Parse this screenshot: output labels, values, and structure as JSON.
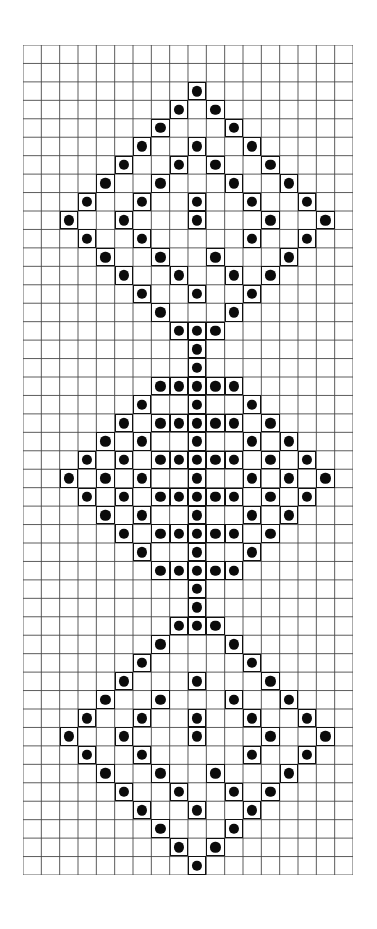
{
  "document": {
    "title": "Beadwork / Cross-Stitch Diamond Motif Chart",
    "media": "graph-paper",
    "background_color": "#ffffff",
    "grid_line_color": "#4a4a4a",
    "cell_outline_color": "#121212",
    "bead_color": "#0b0b0b"
  },
  "chart_data": {
    "type": "heatmap",
    "title": "Beadwork / Cross-Stitch Diamond Motif Chart",
    "xlabel": "",
    "ylabel": "",
    "grid": true,
    "legend_position": "none",
    "columns": 18,
    "rows": 45,
    "cell_width_px": 18.33,
    "cell_height_px": 18.44,
    "origin_px": {
      "x": 23,
      "y": 45
    },
    "value_meaning": {
      "0": "empty square",
      "1": "bead / stitch"
    },
    "motifs": [
      {
        "name": "top-diamond",
        "style": "open-lattice",
        "row_start": 2,
        "row_end": 15,
        "center_column": 9
      },
      {
        "name": "middle-diamond",
        "style": "dense-filled",
        "row_start": 16,
        "row_end": 30,
        "center_column": 9
      },
      {
        "name": "bottom-diamond",
        "style": "open-lattice",
        "row_start": 30,
        "row_end": 44,
        "center_column": 9
      }
    ],
    "filled_cells": [
      [
        2,
        9
      ],
      [
        3,
        8
      ],
      [
        3,
        10
      ],
      [
        4,
        7
      ],
      [
        4,
        11
      ],
      [
        5,
        6
      ],
      [
        5,
        9
      ],
      [
        5,
        12
      ],
      [
        6,
        5
      ],
      [
        6,
        8
      ],
      [
        6,
        10
      ],
      [
        6,
        13
      ],
      [
        7,
        4
      ],
      [
        7,
        7
      ],
      [
        7,
        11
      ],
      [
        7,
        14
      ],
      [
        8,
        3
      ],
      [
        8,
        6
      ],
      [
        8,
        9
      ],
      [
        8,
        12
      ],
      [
        8,
        15
      ],
      [
        9,
        2
      ],
      [
        9,
        5
      ],
      [
        9,
        9
      ],
      [
        9,
        13
      ],
      [
        9,
        16
      ],
      [
        10,
        3
      ],
      [
        10,
        6
      ],
      [
        10,
        12
      ],
      [
        10,
        15
      ],
      [
        11,
        4
      ],
      [
        11,
        7
      ],
      [
        11,
        10
      ],
      [
        11,
        14
      ],
      [
        12,
        5
      ],
      [
        12,
        8
      ],
      [
        12,
        11
      ],
      [
        12,
        13
      ],
      [
        13,
        6
      ],
      [
        13,
        9
      ],
      [
        13,
        12
      ],
      [
        14,
        7
      ],
      [
        14,
        11
      ],
      [
        15,
        8
      ],
      [
        15,
        9
      ],
      [
        15,
        10
      ],
      [
        16,
        9
      ],
      [
        17,
        9
      ],
      [
        18,
        7
      ],
      [
        18,
        8
      ],
      [
        18,
        9
      ],
      [
        18,
        10
      ],
      [
        18,
        11
      ],
      [
        19,
        6
      ],
      [
        19,
        9
      ],
      [
        19,
        12
      ],
      [
        20,
        5
      ],
      [
        20,
        7
      ],
      [
        20,
        8
      ],
      [
        20,
        9
      ],
      [
        20,
        10
      ],
      [
        20,
        11
      ],
      [
        20,
        13
      ],
      [
        21,
        4
      ],
      [
        21,
        6
      ],
      [
        21,
        9
      ],
      [
        21,
        12
      ],
      [
        21,
        14
      ],
      [
        22,
        3
      ],
      [
        22,
        5
      ],
      [
        22,
        7
      ],
      [
        22,
        8
      ],
      [
        22,
        9
      ],
      [
        22,
        10
      ],
      [
        22,
        11
      ],
      [
        22,
        13
      ],
      [
        22,
        15
      ],
      [
        23,
        2
      ],
      [
        23,
        4
      ],
      [
        23,
        6
      ],
      [
        23,
        9
      ],
      [
        23,
        12
      ],
      [
        23,
        14
      ],
      [
        23,
        16
      ],
      [
        24,
        3
      ],
      [
        24,
        5
      ],
      [
        24,
        7
      ],
      [
        24,
        8
      ],
      [
        24,
        9
      ],
      [
        24,
        10
      ],
      [
        24,
        11
      ],
      [
        24,
        13
      ],
      [
        24,
        15
      ],
      [
        25,
        4
      ],
      [
        25,
        6
      ],
      [
        25,
        9
      ],
      [
        25,
        12
      ],
      [
        25,
        14
      ],
      [
        26,
        5
      ],
      [
        26,
        7
      ],
      [
        26,
        8
      ],
      [
        26,
        9
      ],
      [
        26,
        10
      ],
      [
        26,
        11
      ],
      [
        26,
        13
      ],
      [
        27,
        6
      ],
      [
        27,
        9
      ],
      [
        27,
        12
      ],
      [
        28,
        7
      ],
      [
        28,
        8
      ],
      [
        28,
        9
      ],
      [
        28,
        10
      ],
      [
        28,
        11
      ],
      [
        29,
        9
      ],
      [
        30,
        9
      ],
      [
        31,
        8
      ],
      [
        31,
        9
      ],
      [
        31,
        10
      ],
      [
        32,
        7
      ],
      [
        32,
        11
      ],
      [
        33,
        6
      ],
      [
        33,
        12
      ],
      [
        34,
        5
      ],
      [
        34,
        9
      ],
      [
        34,
        13
      ],
      [
        35,
        4
      ],
      [
        35,
        7
      ],
      [
        35,
        11
      ],
      [
        35,
        14
      ],
      [
        36,
        3
      ],
      [
        36,
        6
      ],
      [
        36,
        9
      ],
      [
        36,
        12
      ],
      [
        36,
        15
      ],
      [
        37,
        2
      ],
      [
        37,
        5
      ],
      [
        37,
        9
      ],
      [
        37,
        13
      ],
      [
        37,
        16
      ],
      [
        38,
        3
      ],
      [
        38,
        6
      ],
      [
        38,
        12
      ],
      [
        38,
        15
      ],
      [
        39,
        4
      ],
      [
        39,
        7
      ],
      [
        39,
        10
      ],
      [
        39,
        14
      ],
      [
        40,
        5
      ],
      [
        40,
        8
      ],
      [
        40,
        11
      ],
      [
        40,
        13
      ],
      [
        41,
        6
      ],
      [
        41,
        9
      ],
      [
        41,
        12
      ],
      [
        42,
        7
      ],
      [
        42,
        11
      ],
      [
        43,
        8
      ],
      [
        43,
        10
      ],
      [
        44,
        9
      ]
    ]
  }
}
